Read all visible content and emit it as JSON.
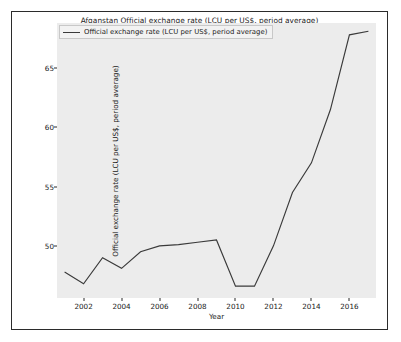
{
  "chart_data": {
    "type": "line",
    "title": "Afganstan Official exchange rate (LCU per US$, period average)",
    "xlabel": "Year",
    "ylabel": "Official exchange rate (LCU per US$, period average)",
    "legend": [
      {
        "name": "Official exchange rate (LCU per US$, period average)",
        "color": "#3a3a3a"
      }
    ],
    "legend_position": "upper left",
    "grid": false,
    "xlim": [
      2000.6,
      2017.4
    ],
    "ylim": [
      45.6,
      68.8
    ],
    "xticks": [
      2002,
      2004,
      2006,
      2008,
      2010,
      2012,
      2014,
      2016
    ],
    "yticks": [
      50,
      55,
      60,
      65
    ],
    "x": [
      2001,
      2002,
      2003,
      2004,
      2005,
      2006,
      2007,
      2008,
      2009,
      2010,
      2011,
      2012,
      2013,
      2014,
      2015,
      2016,
      2017
    ],
    "series": [
      {
        "name": "Official exchange rate (LCU per US$, period average)",
        "color": "#3a3a3a",
        "values": [
          47.8,
          46.8,
          49.0,
          48.1,
          49.5,
          50.0,
          50.1,
          50.3,
          50.5,
          46.6,
          46.6,
          50.0,
          54.5,
          57.0,
          61.5,
          67.8,
          68.1
        ]
      }
    ]
  }
}
